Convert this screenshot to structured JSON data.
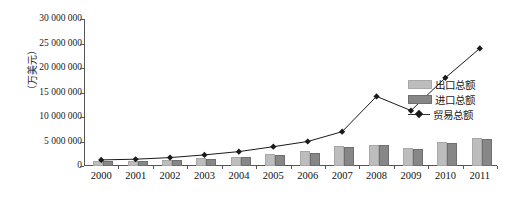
{
  "chart_data": {
    "type": "bar",
    "title": "",
    "subtitle": "",
    "xlabel": "",
    "ylabel": "（万美元）",
    "categories": [
      "2000",
      "2001",
      "2002",
      "2003",
      "2004",
      "2005",
      "2006",
      "2007",
      "2008",
      "2009",
      "2010",
      "2011"
    ],
    "series": [
      {
        "name": "出口总额",
        "type": "bar",
        "color": "#bdbdbd",
        "values": [
          620000,
          700000,
          880000,
          1150000,
          1480000,
          2000000,
          2650000,
          3600000,
          3950000,
          3320000,
          4480000,
          5280000
        ]
      },
      {
        "name": "进口总额",
        "type": "bar",
        "color": "#878787",
        "values": [
          620000,
          680000,
          830000,
          1120000,
          1450000,
          1940000,
          2350000,
          3400000,
          3800000,
          3050000,
          4330000,
          5140000
        ]
      },
      {
        "name": "贸易总额",
        "type": "line",
        "color": "#1a1a1a",
        "values": [
          1240000,
          1380000,
          1710000,
          2270000,
          2930000,
          3940000,
          5000000,
          7000000,
          14200000,
          11300000,
          18000000,
          24000000
        ]
      }
    ],
    "ylim": [
      0,
      30000000
    ],
    "ytick_values": [
      0,
      5000000,
      10000000,
      15000000,
      20000000,
      25000000,
      30000000
    ],
    "ytick_labels": [
      "0",
      "5 000 000",
      "10 000 000",
      "15 000 000",
      "20 000 000",
      "25 000 000",
      "30 000 000"
    ],
    "grid": false,
    "legend_position": "right",
    "legend": [
      "出口总额",
      "进口总额",
      "贸易总额"
    ]
  },
  "legend": {
    "export_label": "出口总额",
    "import_label": "进口总额",
    "trade_label": "贸易总额"
  },
  "axes": {
    "y_title": "（万美元）"
  }
}
